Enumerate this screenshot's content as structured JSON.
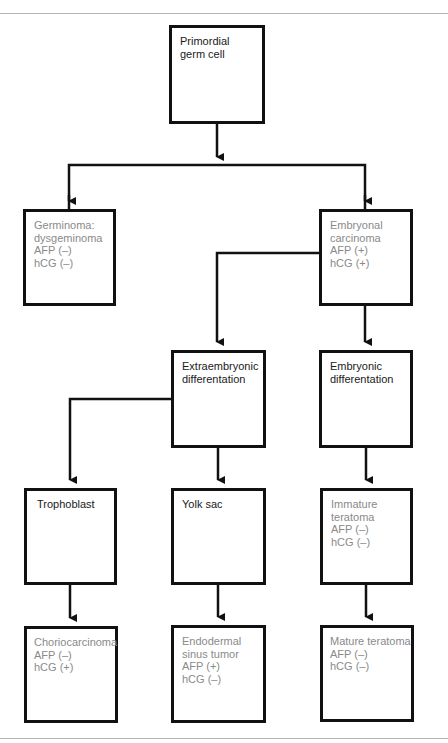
{
  "diagram": {
    "type": "flowchart",
    "colors": {
      "line": "#111111",
      "text_primary": "#1a1a1a",
      "text_secondary": "#8a8a8a",
      "rule": "#b5b5b5"
    },
    "nodes": {
      "primordial": {
        "lines": [
          "Primordial",
          "germ cell"
        ]
      },
      "germinoma": {
        "lines": [
          "Germinoma:",
          "dysgeminoma",
          "AFP (–)",
          "hCG (–)"
        ]
      },
      "embryonal": {
        "lines": [
          "Embryonal",
          "carcinoma",
          "AFP (+)",
          "hCG (+)"
        ]
      },
      "extraembryonic": {
        "lines": [
          "Extraembryonic",
          "differentation"
        ]
      },
      "embryonic": {
        "lines": [
          "Embryonic",
          "differentation"
        ]
      },
      "trophoblast": {
        "lines": [
          "Trophoblast"
        ]
      },
      "yolk_sac": {
        "lines": [
          "Yolk sac"
        ]
      },
      "immature_teratoma": {
        "lines": [
          "Immature",
          "teratoma",
          "AFP (–)",
          "hCG (–)"
        ]
      },
      "choriocarcinoma": {
        "lines": [
          "Choriocarcinoma",
          "AFP (–)",
          "hCG (+)"
        ]
      },
      "endodermal_sinus": {
        "lines": [
          "Endodermal",
          "sinus tumor",
          "AFP (+)",
          "hCG (–)"
        ]
      },
      "mature_teratoma": {
        "lines": [
          "Mature teratoma",
          "AFP (–)",
          "hCG (–)"
        ]
      }
    },
    "edges": [
      [
        "primordial",
        "germinoma"
      ],
      [
        "primordial",
        "embryonal"
      ],
      [
        "embryonal",
        "extraembryonic"
      ],
      [
        "embryonal",
        "embryonic"
      ],
      [
        "extraembryonic",
        "trophoblast"
      ],
      [
        "extraembryonic",
        "yolk_sac"
      ],
      [
        "embryonic",
        "immature_teratoma"
      ],
      [
        "trophoblast",
        "choriocarcinoma"
      ],
      [
        "yolk_sac",
        "endodermal_sinus"
      ],
      [
        "immature_teratoma",
        "mature_teratoma"
      ]
    ]
  }
}
